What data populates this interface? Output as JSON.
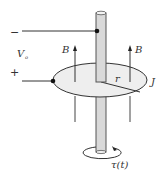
{
  "diagram": {
    "labels": {
      "minus": "−",
      "plus": "+",
      "voltage": "V",
      "voltage_sub": "o",
      "field_left": "B",
      "field_right": "B",
      "radius": "r",
      "current_density": "J",
      "torque": "τ(t)"
    },
    "colors": {
      "stroke": "#222222",
      "rod_fill": "#d9d9d9",
      "disk_fill": "#eeeeee",
      "background": "#ffffff"
    }
  }
}
